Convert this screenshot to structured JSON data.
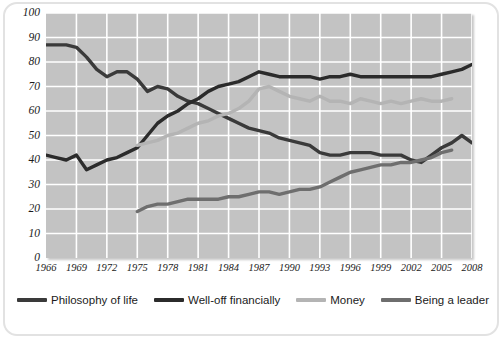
{
  "chart_data": {
    "type": "line",
    "title": "",
    "xlabel": "",
    "ylabel": "",
    "xlim": [
      1966,
      2008
    ],
    "ylim": [
      0,
      100
    ],
    "grid": true,
    "legend_position": "bottom",
    "y_ticks": [
      100,
      90,
      80,
      70,
      60,
      50,
      40,
      30,
      20,
      10,
      0
    ],
    "x_ticks": [
      1966,
      1969,
      1972,
      1975,
      1978,
      1981,
      1984,
      1987,
      1990,
      1993,
      1996,
      1999,
      2002,
      2005,
      2008
    ],
    "series": [
      {
        "name": "Philosophy of life",
        "color": "#3a3a3a",
        "x": [
          1966,
          1967,
          1968,
          1969,
          1970,
          1971,
          1972,
          1973,
          1974,
          1975,
          1976,
          1977,
          1978,
          1979,
          1980,
          1981,
          1982,
          1983,
          1984,
          1985,
          1986,
          1987,
          1988,
          1989,
          1990,
          1991,
          1992,
          1993,
          1994,
          1995,
          1996,
          1997,
          1998,
          1999,
          2000,
          2001,
          2002,
          2003,
          2004,
          2005,
          2006,
          2007,
          2008
        ],
        "y": [
          87,
          87,
          87,
          86,
          82,
          77,
          74,
          76,
          76,
          73,
          68,
          70,
          69,
          66,
          64,
          63,
          61,
          59,
          57,
          55,
          53,
          52,
          51,
          49,
          48,
          47,
          46,
          43,
          42,
          42,
          43,
          43,
          43,
          42,
          42,
          42,
          40,
          39,
          42,
          45,
          47,
          50,
          47
        ]
      },
      {
        "name": "Well-off financially",
        "color": "#2b2b2b",
        "x": [
          1966,
          1967,
          1968,
          1969,
          1970,
          1971,
          1972,
          1973,
          1974,
          1975,
          1976,
          1977,
          1978,
          1979,
          1980,
          1981,
          1982,
          1983,
          1984,
          1985,
          1986,
          1987,
          1988,
          1989,
          1990,
          1991,
          1992,
          1993,
          1994,
          1995,
          1996,
          1997,
          1998,
          1999,
          2000,
          2001,
          2002,
          2003,
          2004,
          2005,
          2006,
          2007,
          2008
        ],
        "y": [
          42,
          41,
          40,
          42,
          36,
          38,
          40,
          41,
          43,
          45,
          50,
          55,
          58,
          60,
          63,
          65,
          68,
          70,
          71,
          72,
          74,
          76,
          75,
          74,
          74,
          74,
          74,
          73,
          74,
          74,
          75,
          74,
          74,
          74,
          74,
          74,
          74,
          74,
          74,
          75,
          76,
          77,
          79
        ]
      },
      {
        "name": "Money",
        "color": "#b4b4b4",
        "x": [
          1975,
          1976,
          1977,
          1978,
          1979,
          1980,
          1981,
          1982,
          1983,
          1984,
          1985,
          1986,
          1987,
          1988,
          1989,
          1990,
          1991,
          1992,
          1993,
          1994,
          1995,
          1996,
          1997,
          1998,
          1999,
          2000,
          2001,
          2002,
          2003,
          2004,
          2005,
          2006
        ],
        "y": [
          46,
          47,
          48,
          50,
          51,
          53,
          55,
          56,
          58,
          59,
          61,
          64,
          69,
          70,
          68,
          66,
          65,
          64,
          66,
          64,
          64,
          63,
          65,
          64,
          63,
          64,
          63,
          64,
          65,
          64,
          64,
          65
        ]
      },
      {
        "name": "Being a leader",
        "color": "#6e6e6e",
        "x": [
          1975,
          1976,
          1977,
          1978,
          1979,
          1980,
          1981,
          1982,
          1983,
          1984,
          1985,
          1986,
          1987,
          1988,
          1989,
          1990,
          1991,
          1992,
          1993,
          1994,
          1995,
          1996,
          1997,
          1998,
          1999,
          2000,
          2001,
          2002,
          2003,
          2004,
          2005,
          2006
        ],
        "y": [
          19,
          21,
          22,
          22,
          23,
          24,
          24,
          24,
          24,
          25,
          25,
          26,
          27,
          27,
          26,
          27,
          28,
          28,
          29,
          31,
          33,
          35,
          36,
          37,
          38,
          38,
          39,
          39,
          40,
          41,
          43,
          44
        ]
      }
    ]
  },
  "legend": {
    "items": [
      {
        "label": "Philosophy of life",
        "color": "#3a3a3a"
      },
      {
        "label": "Well-off financially",
        "color": "#2b2b2b"
      },
      {
        "label": "Money",
        "color": "#b4b4b4"
      },
      {
        "label": "Being a leader",
        "color": "#6e6e6e"
      }
    ]
  },
  "style": {
    "plot_background": "#c3c3c3",
    "grid_color": "#ffffff",
    "page_background": "#ffffff",
    "text_color": "#1b1b1b"
  }
}
